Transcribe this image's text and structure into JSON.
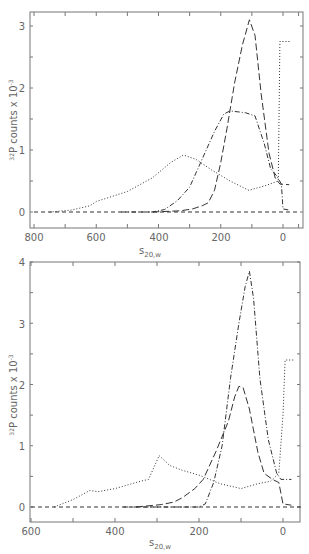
{
  "chart_data": [
    {
      "type": "line",
      "title": "",
      "xlabel": "s20,w",
      "ylabel": "32P counts x 10^-3",
      "xlim": [
        800,
        -50
      ],
      "ylim": [
        -0.2,
        3.3
      ],
      "x_ticks": [
        800,
        600,
        400,
        200,
        0
      ],
      "y_ticks": [
        0,
        1,
        2,
        3
      ],
      "grid": false,
      "legend": "none",
      "series": [
        {
          "name": "dotted",
          "style": "dotted",
          "points": [
            [
              750,
              0
            ],
            [
              680,
              0.03
            ],
            [
              620,
              0.1
            ],
            [
              600,
              0.17
            ],
            [
              500,
              0.33
            ],
            [
              420,
              0.55
            ],
            [
              360,
              0.8
            ],
            [
              320,
              0.92
            ],
            [
              280,
              0.85
            ],
            [
              230,
              0.68
            ],
            [
              170,
              0.5
            ],
            [
              110,
              0.35
            ],
            [
              60,
              0.42
            ],
            [
              15,
              0.5
            ],
            [
              10,
              2.75
            ],
            [
              -25,
              2.75
            ]
          ]
        },
        {
          "name": "dash-dot",
          "style": "dashdot",
          "points": [
            [
              520,
              0
            ],
            [
              420,
              0
            ],
            [
              380,
              0.04
            ],
            [
              340,
              0.18
            ],
            [
              300,
              0.4
            ],
            [
              260,
              0.85
            ],
            [
              220,
              1.3
            ],
            [
              190,
              1.58
            ],
            [
              170,
              1.63
            ],
            [
              120,
              1.6
            ],
            [
              90,
              1.55
            ],
            [
              60,
              1.1
            ],
            [
              40,
              0.7
            ],
            [
              20,
              0.58
            ],
            [
              5,
              0.45
            ],
            [
              0,
              0.05
            ],
            [
              -20,
              0.03
            ]
          ]
        },
        {
          "name": "dashed",
          "style": "dashed",
          "points": [
            [
              420,
              0
            ],
            [
              330,
              0.02
            ],
            [
              290,
              0.05
            ],
            [
              260,
              0.1
            ],
            [
              240,
              0.15
            ],
            [
              220,
              0.35
            ],
            [
              200,
              0.8
            ],
            [
              180,
              1.35
            ],
            [
              155,
              2.1
            ],
            [
              130,
              2.7
            ],
            [
              108,
              3.1
            ],
            [
              90,
              2.85
            ],
            [
              70,
              1.9
            ],
            [
              45,
              0.95
            ],
            [
              25,
              0.55
            ],
            [
              10,
              0.45
            ],
            [
              -20,
              0.44
            ]
          ]
        },
        {
          "name": "baseline",
          "style": "dashed-light",
          "points": [
            [
              800,
              0
            ],
            [
              -50,
              0
            ]
          ]
        }
      ]
    },
    {
      "type": "line",
      "title": "",
      "xlabel": "s20,w",
      "ylabel": "32P counts x 10^-3",
      "xlim": [
        600,
        -50
      ],
      "ylim": [
        -0.3,
        4
      ],
      "x_ticks": [
        600,
        400,
        200,
        0
      ],
      "y_ticks": [
        0,
        1,
        2,
        3,
        4
      ],
      "grid": false,
      "legend": "none",
      "series": [
        {
          "name": "dotted",
          "style": "dotted",
          "points": [
            [
              545,
              0
            ],
            [
              500,
              0.12
            ],
            [
              460,
              0.27
            ],
            [
              440,
              0.25
            ],
            [
              400,
              0.3
            ],
            [
              340,
              0.42
            ],
            [
              320,
              0.45
            ],
            [
              295,
              0.84
            ],
            [
              270,
              0.68
            ],
            [
              240,
              0.6
            ],
            [
              200,
              0.52
            ],
            [
              150,
              0.38
            ],
            [
              100,
              0.3
            ],
            [
              60,
              0.38
            ],
            [
              30,
              0.42
            ],
            [
              10,
              0.55
            ],
            [
              0,
              1.5
            ],
            [
              -5,
              2.4
            ],
            [
              -25,
              2.4
            ]
          ]
        },
        {
          "name": "dash-dot",
          "style": "dashdot",
          "points": [
            [
              380,
              0
            ],
            [
              200,
              0
            ],
            [
              185,
              0.05
            ],
            [
              165,
              0.4
            ],
            [
              145,
              1.0
            ],
            [
              125,
              2.1
            ],
            [
              105,
              3.0
            ],
            [
              90,
              3.6
            ],
            [
              80,
              3.85
            ],
            [
              70,
              3.4
            ],
            [
              55,
              2.1
            ],
            [
              35,
              1.1
            ],
            [
              15,
              0.55
            ],
            [
              5,
              0.45
            ],
            [
              -20,
              0.45
            ]
          ]
        },
        {
          "name": "dashed",
          "style": "dashed",
          "points": [
            [
              350,
              0
            ],
            [
              290,
              0.04
            ],
            [
              260,
              0.08
            ],
            [
              240,
              0.15
            ],
            [
              210,
              0.3
            ],
            [
              190,
              0.45
            ],
            [
              160,
              0.9
            ],
            [
              130,
              1.4
            ],
            [
              115,
              1.8
            ],
            [
              105,
              1.97
            ],
            [
              95,
              1.95
            ],
            [
              80,
              1.6
            ],
            [
              60,
              0.9
            ],
            [
              45,
              0.55
            ],
            [
              25,
              0.45
            ],
            [
              10,
              0.4
            ],
            [
              0,
              0.05
            ],
            [
              -20,
              0.03
            ]
          ]
        },
        {
          "name": "baseline",
          "style": "dashed-light",
          "points": [
            [
              600,
              0
            ],
            [
              -50,
              0
            ]
          ]
        }
      ]
    }
  ],
  "labels": {
    "top": {
      "ylabel_prefix": "32",
      "ylabel_main": "P counts x 10",
      "ylabel_exp": "-3",
      "xlabel_main": "s",
      "xlabel_sub": "20,w",
      "x_tick_labels": [
        "800",
        "600",
        "400",
        "200",
        "0"
      ],
      "y_tick_labels": [
        "0",
        "1",
        "2",
        "3"
      ]
    },
    "bottom": {
      "ylabel_prefix": "32",
      "ylabel_main": "P counts x 10",
      "ylabel_exp": "-3",
      "xlabel_main": "s",
      "xlabel_sub": "20,w",
      "x_tick_labels": [
        "600",
        "400",
        "200",
        "0"
      ],
      "y_tick_labels": [
        "0",
        "1",
        "2",
        "3",
        "4"
      ]
    }
  }
}
